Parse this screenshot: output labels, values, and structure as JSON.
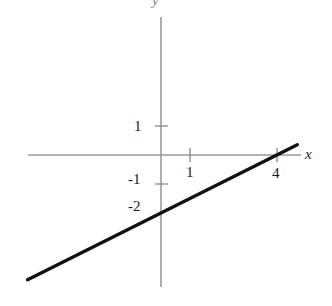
{
  "chart_data": {
    "type": "line",
    "title": "",
    "xlabel": "x",
    "ylabel": "y",
    "grid": false,
    "legend": null,
    "xlim": [
      -4.6,
      4.8
    ],
    "ylim": [
      -4.5,
      4.8
    ],
    "x_ticks": [
      {
        "value": 1,
        "label": "1"
      },
      {
        "value": 4,
        "label": "4"
      }
    ],
    "y_ticks": [
      {
        "value": 1,
        "label": "1"
      },
      {
        "value": -1,
        "label": "-1"
      },
      {
        "value": -2,
        "label": "-2"
      }
    ],
    "series": [
      {
        "name": "line",
        "equation": "y = x/2 - 2",
        "slope": 0.5,
        "y_intercept": -2,
        "x_intercept": 4,
        "color": "#111111",
        "x": [
          -4.6,
          4.7
        ],
        "values": [
          -4.3,
          0.35
        ]
      }
    ],
    "axis_color": "#9a9a9a",
    "line_color": "#111111"
  },
  "axes": {
    "x_name": "x",
    "y_name": "y"
  },
  "ticks": {
    "y_one": "1",
    "y_minus_one": "-1",
    "y_minus_two": "-2",
    "x_one": "1",
    "x_four": "4"
  }
}
